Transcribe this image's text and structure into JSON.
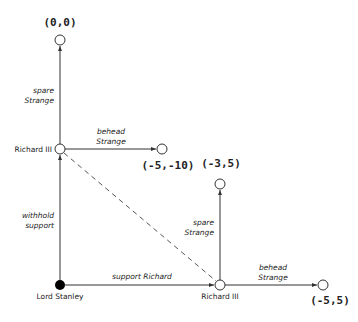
{
  "diagram": {
    "type": "game-tree",
    "colors": {
      "line": "#333333",
      "decision_node_fill": "#000000",
      "open_node_fill": "#ffffff",
      "text": "#222222"
    },
    "nodes": [
      {
        "id": "stanley",
        "label": "Lord Stanley",
        "kind": "decision",
        "filled": true
      },
      {
        "id": "richard_top",
        "label": "Richard III",
        "kind": "decision",
        "filled": false
      },
      {
        "id": "richard_bottom",
        "label": "Richard III",
        "kind": "decision",
        "filled": false
      },
      {
        "id": "t_00",
        "payoff": "(0,0)",
        "kind": "terminal"
      },
      {
        "id": "t_m5m10",
        "payoff": "(-5,-10)",
        "kind": "terminal"
      },
      {
        "id": "t_m35",
        "payoff": "(-3,5)",
        "kind": "terminal"
      },
      {
        "id": "t_m55",
        "payoff": "(-5,5)",
        "kind": "terminal"
      }
    ],
    "edges": [
      {
        "from": "stanley",
        "to": "richard_top",
        "label_line1": "withhold",
        "label_line2": "support"
      },
      {
        "from": "stanley",
        "to": "richard_bottom",
        "label_line1": "support Richard",
        "label_line2": ""
      },
      {
        "from": "richard_top",
        "to": "t_00",
        "label_line1": "spare",
        "label_line2": "Strange"
      },
      {
        "from": "richard_top",
        "to": "t_m5m10",
        "label_line1": "behead",
        "label_line2": "Strange"
      },
      {
        "from": "richard_bottom",
        "to": "t_m35",
        "label_line1": "spare",
        "label_line2": "Strange"
      },
      {
        "from": "richard_bottom",
        "to": "t_m55",
        "label_line1": "behead",
        "label_line2": "Strange"
      }
    ],
    "information_set": {
      "nodes": [
        "richard_top",
        "richard_bottom"
      ],
      "style": "dashed"
    }
  }
}
